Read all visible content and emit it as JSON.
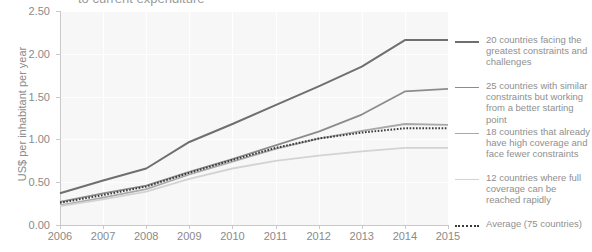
{
  "chart_data": {
    "type": "line",
    "title": "to current expenditure",
    "xlabel": "",
    "ylabel": "US$ per inhabitant per year",
    "x": [
      2006,
      2007,
      2008,
      2009,
      2010,
      2011,
      2012,
      2013,
      2014,
      2015
    ],
    "categories": [
      "2006",
      "2007",
      "2008",
      "2009",
      "2010",
      "2011",
      "2012",
      "2013",
      "2014",
      "2015"
    ],
    "xlim": [
      2006,
      2015
    ],
    "ylim": [
      0.0,
      2.5
    ],
    "yticks": [
      "0.00",
      "0.50",
      "1.00",
      "1.50",
      "2.00",
      "2.50"
    ],
    "ytick_values": [
      0.0,
      0.5,
      1.0,
      1.5,
      2.0,
      2.5
    ],
    "grid": true,
    "legend_position": "right",
    "series": [
      {
        "name": "20 countries facing the greatest constraints and challenges",
        "color": "#6f6f6f",
        "style": "solid",
        "width": 2.0,
        "values": [
          0.37,
          0.52,
          0.66,
          0.97,
          1.18,
          1.4,
          1.62,
          1.85,
          2.16,
          2.16
        ]
      },
      {
        "name": "25 countries with similar constraints but working from a better starting point",
        "color": "#8c8c8c",
        "style": "solid",
        "width": 1.8,
        "values": [
          0.27,
          0.37,
          0.46,
          0.62,
          0.77,
          0.93,
          1.09,
          1.29,
          1.56,
          1.59
        ]
      },
      {
        "name": "18 countries that already have high coverage and face fewer constraints",
        "color": "#a9a9a9",
        "style": "solid",
        "width": 1.8,
        "values": [
          0.23,
          0.32,
          0.42,
          0.59,
          0.74,
          0.89,
          1.01,
          1.1,
          1.18,
          1.17
        ]
      },
      {
        "name": "12 countries where full coverage can be reached rapidly",
        "color": "#d3d3d3",
        "style": "solid",
        "width": 1.8,
        "values": [
          0.22,
          0.3,
          0.39,
          0.54,
          0.66,
          0.75,
          0.81,
          0.86,
          0.9,
          0.9
        ]
      },
      {
        "name": "Average (75 countries)",
        "color": "#3a3a3a",
        "style": "dotted",
        "width": 2.0,
        "values": [
          0.26,
          0.35,
          0.45,
          0.61,
          0.76,
          0.9,
          1.01,
          1.08,
          1.13,
          1.13
        ]
      }
    ]
  },
  "axis": {
    "y_title": "US$ per inhabitant per year"
  },
  "legend": {
    "items": [
      {
        "label": "20 countries facing the greatest constraints and challenges"
      },
      {
        "label": "25 countries with similar constraints but working from a better starting point"
      },
      {
        "label": "18 countries that already have high coverage and face fewer constraints"
      },
      {
        "label": "12 countries where full coverage can be reached rapidly"
      },
      {
        "label": "Average (75 countries)"
      }
    ]
  }
}
